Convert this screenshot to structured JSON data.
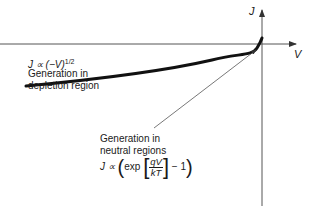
{
  "diagram": {
    "axes": {
      "x_label": "V",
      "y_label": "J"
    },
    "annotations": {
      "depletion": {
        "formula_prefix": "J ∝ (−V)",
        "formula_exponent": "1/2",
        "line1": "Generation in",
        "line2": "depletion region"
      },
      "neutral": {
        "line1": "Generation in",
        "line2": "neutral regions",
        "formula_prefix": "J ∝",
        "exp_label": "exp",
        "frac_num": "qV",
        "frac_den": "kT",
        "formula_suffix": "− 1"
      }
    },
    "colors": {
      "curve": "#111111",
      "axis": "#555555",
      "text": "#1a1a1a"
    }
  }
}
